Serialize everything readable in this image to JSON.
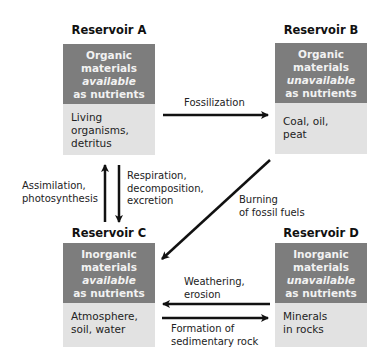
{
  "reservoirs": {
    "a": {
      "title": "Reservoir A",
      "header": [
        "Organic",
        "materials",
        "available",
        "as nutrients"
      ],
      "contents": [
        "Living",
        "organisms,",
        "detritus"
      ]
    },
    "b": {
      "title": "Reservoir B",
      "header": [
        "Organic",
        "materials",
        "unavailable",
        "as nutrients"
      ],
      "contents": [
        "Coal, oil,",
        "peat"
      ]
    },
    "c": {
      "title": "Reservoir C",
      "header": [
        "Inorganic",
        "materials",
        "available",
        "as nutrients"
      ],
      "contents": [
        "Atmosphere,",
        "soil, water"
      ]
    },
    "d": {
      "title": "Reservoir D",
      "header": [
        "Inorganic",
        "materials",
        "unavailable",
        "as nutrients"
      ],
      "contents": [
        "Minerals",
        "in rocks"
      ]
    }
  },
  "processes": {
    "fossilization": [
      "Fossilization"
    ],
    "assimilation": [
      "Assimilation,",
      "photosynthesis"
    ],
    "respiration": [
      "Respiration,",
      "decomposition,",
      "excretion"
    ],
    "burning": [
      "Burning",
      "of fossil fuels"
    ],
    "weathering": [
      "Weathering,",
      "erosion"
    ],
    "formation": [
      "Formation of",
      "sedimentary rock"
    ]
  },
  "colors": {
    "dark_box": "#7d7d7d",
    "light_box": "#e2e2e2",
    "arrow": "#111111"
  }
}
